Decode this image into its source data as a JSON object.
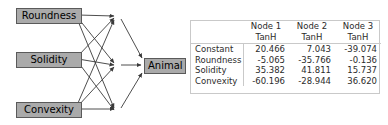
{
  "diagram": {
    "input_nodes": [
      {
        "id": "roundness",
        "label": "Roundness"
      },
      {
        "id": "solidity",
        "label": "Solidity"
      },
      {
        "id": "convexity",
        "label": "Convexity"
      }
    ],
    "hidden_nodes": [
      {
        "id": "node1",
        "label": ""
      },
      {
        "id": "node2",
        "label": ""
      },
      {
        "id": "node3",
        "label": ""
      }
    ],
    "output_node": {
      "id": "animal",
      "label": "Animal"
    },
    "colors": {
      "node_fill": "#aaaaaa",
      "node_border": "#5a5a5a",
      "edge": "#3a3a3a",
      "background": "#ffffff"
    }
  },
  "table": {
    "corner_label": "",
    "column_headers": [
      {
        "name": "Node 1",
        "activation": "TanH"
      },
      {
        "name": "Node 2",
        "activation": "TanH"
      },
      {
        "name": "Node 3",
        "activation": "TanH"
      }
    ],
    "rows": [
      {
        "label": "Constant",
        "values": [
          "20.466",
          "7.043",
          "-39.074"
        ]
      },
      {
        "label": "Roundness",
        "values": [
          "-5.065",
          "-35.766",
          "-0.136"
        ]
      },
      {
        "label": "Solidity",
        "values": [
          "35.382",
          "41.811",
          "15.737"
        ]
      },
      {
        "label": "Convexity",
        "values": [
          "-60.196",
          "-28.944",
          "36.620"
        ]
      }
    ],
    "border_color": "#c9c9c9"
  }
}
